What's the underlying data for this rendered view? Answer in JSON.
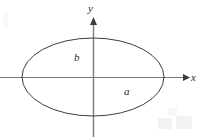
{
  "figure": {
    "background_color": "#ffffff",
    "width": 201,
    "height": 137
  },
  "axes": {
    "x_label": "x",
    "y_label": "y",
    "axis_color": "#7a7a7a",
    "arrow_color": "#3a3a3a",
    "origin": {
      "x": 93,
      "y": 77
    },
    "x_axis": {
      "start_x": 0,
      "end_x": 188,
      "y": 77
    },
    "y_axis": {
      "x": 93,
      "start_y": 137,
      "end_y": 20
    }
  },
  "curve": {
    "type": "ellipse",
    "stroke_color": "#3d3d3d",
    "stroke_width": 1,
    "fill": "none",
    "center": {
      "x": 93,
      "y": 77
    },
    "semi_axis_x": 71,
    "semi_axis_y": 39
  },
  "labels": {
    "semi_minor": "b",
    "semi_major": "a",
    "semi_minor_position": {
      "x": 74,
      "y": 52
    },
    "semi_major_position": {
      "x": 124,
      "y": 86
    }
  },
  "chart_data": {
    "type": "line",
    "xlabel": "x",
    "ylabel": "y",
    "annotations": [
      "b",
      "a"
    ],
    "series": [
      {
        "name": "ellipse",
        "equation": "x^2/a^2 + y^2/b^2 = 1",
        "semi_major_axis_label": "a",
        "semi_minor_axis_label": "b"
      }
    ],
    "grid": false,
    "legend": "none"
  }
}
